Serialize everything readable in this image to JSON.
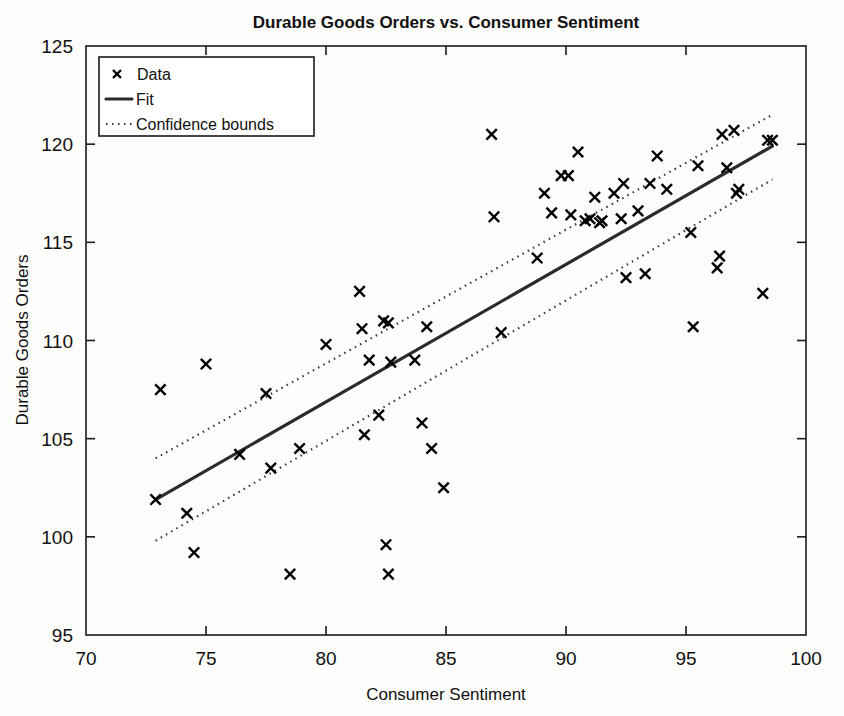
{
  "chart_data": {
    "type": "scatter",
    "title": "Durable Goods Orders vs. Consumer Sentiment",
    "xlabel": "Consumer Sentiment",
    "ylabel": "Durable Goods Orders",
    "xlim": [
      70,
      100
    ],
    "ylim": [
      95,
      125
    ],
    "xticks": [
      70,
      75,
      80,
      85,
      90,
      95,
      100
    ],
    "yticks": [
      95,
      100,
      105,
      110,
      115,
      120,
      125
    ],
    "grid": false,
    "legend_position": "upper left",
    "legend": [
      {
        "label": "Data",
        "style": "marker-x"
      },
      {
        "label": "Fit",
        "style": "solid-line"
      },
      {
        "label": "Confidence bounds",
        "style": "dotted-line"
      }
    ],
    "points": [
      {
        "x": 72.9,
        "y": 101.9
      },
      {
        "x": 73.1,
        "y": 107.5
      },
      {
        "x": 74.2,
        "y": 101.2
      },
      {
        "x": 74.5,
        "y": 99.2
      },
      {
        "x": 75.0,
        "y": 108.8
      },
      {
        "x": 76.4,
        "y": 104.2
      },
      {
        "x": 77.5,
        "y": 107.3
      },
      {
        "x": 77.7,
        "y": 103.5
      },
      {
        "x": 78.5,
        "y": 98.1
      },
      {
        "x": 78.9,
        "y": 104.5
      },
      {
        "x": 80.0,
        "y": 109.8
      },
      {
        "x": 81.4,
        "y": 112.5
      },
      {
        "x": 81.5,
        "y": 110.6
      },
      {
        "x": 81.6,
        "y": 105.2
      },
      {
        "x": 81.8,
        "y": 109.0
      },
      {
        "x": 82.2,
        "y": 106.2
      },
      {
        "x": 82.4,
        "y": 111.0
      },
      {
        "x": 82.6,
        "y": 110.9
      },
      {
        "x": 82.5,
        "y": 99.6
      },
      {
        "x": 82.6,
        "y": 98.1
      },
      {
        "x": 82.7,
        "y": 108.9
      },
      {
        "x": 83.7,
        "y": 109.0
      },
      {
        "x": 84.0,
        "y": 105.8
      },
      {
        "x": 84.2,
        "y": 110.7
      },
      {
        "x": 84.4,
        "y": 104.5
      },
      {
        "x": 84.9,
        "y": 102.5
      },
      {
        "x": 86.9,
        "y": 120.5
      },
      {
        "x": 87.0,
        "y": 116.3
      },
      {
        "x": 87.3,
        "y": 110.4
      },
      {
        "x": 88.8,
        "y": 114.2
      },
      {
        "x": 89.1,
        "y": 117.5
      },
      {
        "x": 89.4,
        "y": 116.5
      },
      {
        "x": 89.8,
        "y": 118.4
      },
      {
        "x": 90.1,
        "y": 118.4
      },
      {
        "x": 90.2,
        "y": 116.4
      },
      {
        "x": 90.5,
        "y": 119.6
      },
      {
        "x": 90.8,
        "y": 116.1
      },
      {
        "x": 91.0,
        "y": 116.2
      },
      {
        "x": 91.2,
        "y": 117.3
      },
      {
        "x": 91.4,
        "y": 116.0
      },
      {
        "x": 91.5,
        "y": 116.1
      },
      {
        "x": 92.0,
        "y": 117.5
      },
      {
        "x": 92.3,
        "y": 116.2
      },
      {
        "x": 92.4,
        "y": 118.0
      },
      {
        "x": 92.5,
        "y": 113.2
      },
      {
        "x": 93.0,
        "y": 116.6
      },
      {
        "x": 93.3,
        "y": 113.4
      },
      {
        "x": 93.5,
        "y": 118.0
      },
      {
        "x": 93.8,
        "y": 119.4
      },
      {
        "x": 94.2,
        "y": 117.7
      },
      {
        "x": 95.2,
        "y": 115.5
      },
      {
        "x": 95.3,
        "y": 110.7
      },
      {
        "x": 95.5,
        "y": 118.9
      },
      {
        "x": 96.3,
        "y": 113.7
      },
      {
        "x": 96.4,
        "y": 114.3
      },
      {
        "x": 96.5,
        "y": 120.5
      },
      {
        "x": 96.7,
        "y": 118.8
      },
      {
        "x": 97.0,
        "y": 120.7
      },
      {
        "x": 97.1,
        "y": 117.5
      },
      {
        "x": 97.2,
        "y": 117.7
      },
      {
        "x": 98.2,
        "y": 112.4
      },
      {
        "x": 98.4,
        "y": 120.2
      },
      {
        "x": 98.6,
        "y": 120.2
      }
    ],
    "fit": {
      "x": [
        72.9,
        98.6
      ],
      "y": [
        101.9,
        119.9
      ]
    },
    "upper_bound": {
      "x": [
        72.9,
        98.6
      ],
      "y": [
        104.0,
        121.5
      ]
    },
    "lower_bound": {
      "x": [
        72.9,
        98.6
      ],
      "y": [
        99.8,
        118.2
      ]
    }
  }
}
